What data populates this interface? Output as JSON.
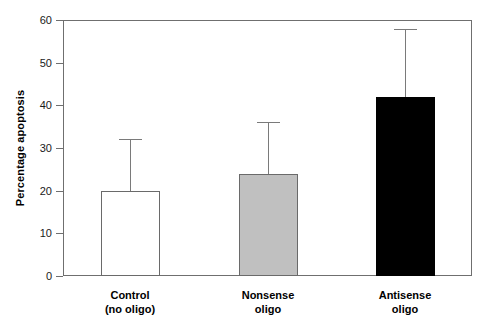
{
  "chart_data": {
    "type": "bar",
    "title": "",
    "xlabel": "",
    "ylabel": "Percentage apoptosis",
    "ylim": [
      0,
      60
    ],
    "yticks": [
      0,
      10,
      20,
      30,
      40,
      50,
      60
    ],
    "ytick_labels": [
      "0",
      "10",
      "20",
      "30",
      "40",
      "50",
      "60"
    ],
    "grid": false,
    "legend": false,
    "categories": [
      "Control (no oligo)",
      "Nonsense oligo",
      "Antisense oligo"
    ],
    "values": [
      20,
      24,
      42
    ],
    "errors_upper": [
      32,
      36,
      58
    ],
    "error_magnitudes": [
      12,
      12,
      16
    ],
    "bar_colors": [
      "#ffffff",
      "#c0c0c0",
      "#000000"
    ],
    "series": [
      {
        "name": "Percentage apoptosis",
        "values": [
          20,
          24,
          42
        ]
      }
    ]
  },
  "axis": {
    "y_title": "Percentage apoptosis",
    "ticks": [
      {
        "value": 60,
        "label": "60"
      },
      {
        "value": 50,
        "label": "50"
      },
      {
        "value": 40,
        "label": "40"
      },
      {
        "value": 30,
        "label": "30"
      },
      {
        "value": 20,
        "label": "20"
      },
      {
        "value": 10,
        "label": "10"
      },
      {
        "value": 0,
        "label": "0"
      }
    ]
  },
  "bars": [
    {
      "key": "control",
      "label_line1": "Control",
      "label_line2": "(no oligo)",
      "value": 20,
      "error_top": 32,
      "fill": "#ffffff"
    },
    {
      "key": "nonsense",
      "label_line1": "Nonsense",
      "label_line2": "oligo",
      "value": 24,
      "error_top": 36,
      "fill": "#c0c0c0"
    },
    {
      "key": "antisense",
      "label_line1": "Antisense",
      "label_line2": "oligo",
      "value": 42,
      "error_top": 58,
      "fill": "#000000"
    }
  ]
}
